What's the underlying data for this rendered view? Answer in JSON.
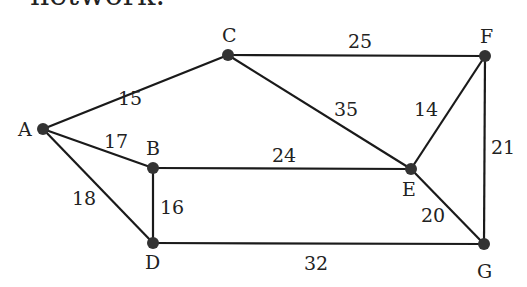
{
  "header": {
    "text": "network."
  },
  "graph": {
    "nodes": [
      {
        "id": "A",
        "label": "A"
      },
      {
        "id": "B",
        "label": "B"
      },
      {
        "id": "C",
        "label": "C"
      },
      {
        "id": "D",
        "label": "D"
      },
      {
        "id": "E",
        "label": "E"
      },
      {
        "id": "F",
        "label": "F"
      },
      {
        "id": "G",
        "label": "G"
      }
    ],
    "edges": [
      {
        "from": "A",
        "to": "C",
        "weight": "15"
      },
      {
        "from": "A",
        "to": "B",
        "weight": "17"
      },
      {
        "from": "A",
        "to": "D",
        "weight": "18"
      },
      {
        "from": "B",
        "to": "D",
        "weight": "16"
      },
      {
        "from": "B",
        "to": "E",
        "weight": "24"
      },
      {
        "from": "C",
        "to": "F",
        "weight": "25"
      },
      {
        "from": "C",
        "to": "E",
        "weight": "35"
      },
      {
        "from": "E",
        "to": "F",
        "weight": "14"
      },
      {
        "from": "F",
        "to": "G",
        "weight": "21"
      },
      {
        "from": "E",
        "to": "G",
        "weight": "20"
      },
      {
        "from": "D",
        "to": "G",
        "weight": "32"
      }
    ]
  }
}
